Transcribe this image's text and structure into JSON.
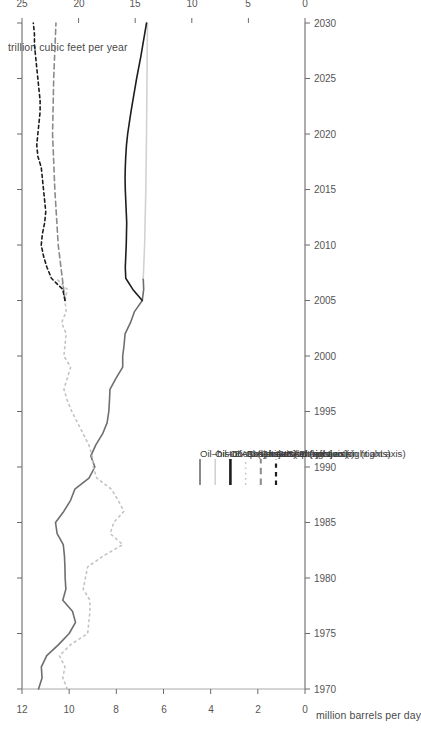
{
  "figure": {
    "orientation": "rotated-90-ccw",
    "background": "#ffffff"
  },
  "axes": {
    "left_axis_title": "million barrels per day",
    "right_axis_title": "trillion cubic feet per year",
    "left_ticks": [
      "0",
      "2",
      "4",
      "6",
      "8",
      "10",
      "12"
    ],
    "right_ticks": [
      "0",
      "5",
      "10",
      "15",
      "20",
      "25"
    ],
    "x_ticks": [
      "1970",
      "1975",
      "1980",
      "1985",
      "1990",
      "1995",
      "2000",
      "2005",
      "2010",
      "2015",
      "2020",
      "2025",
      "2030"
    ]
  },
  "legend": {
    "items": [
      {
        "label": "Oil–historical (left axis)",
        "style": "solid",
        "color": "#6e6e6e",
        "width": 1.6
      },
      {
        "label": "Oil–IEA projection (left axis)",
        "style": "solid",
        "color": "#d2d2d2",
        "width": 1.6
      },
      {
        "label": "Oil–EIA projection (left axis)",
        "style": "solid",
        "color": "#1d1d1d",
        "width": 2.6
      },
      {
        "label": "Gas–historical (right axis)",
        "style": "dotted",
        "color": "#c3c3c3",
        "width": 1.5
      },
      {
        "label": "Gas–IEA projection (right axis)",
        "style": "dashed",
        "color": "#8a8a8a",
        "width": 2.0
      },
      {
        "label": "Gas–EIA projection (right axis)",
        "style": "dashdot",
        "color": "#1d1d1d",
        "width": 2.2
      }
    ]
  },
  "chart_data": {
    "type": "line",
    "title": "",
    "xlabel": "",
    "ylabel": "million barrels per day",
    "y2label": "trillion cubic feet per year",
    "xlim": [
      1970,
      2030
    ],
    "ylim": [
      0,
      12
    ],
    "y2lim": [
      0,
      25
    ],
    "grid": false,
    "legend_position": "bottom-center",
    "series": [
      {
        "name": "Oil–historical (left axis)",
        "axis": "left",
        "style": "solid",
        "color": "#6e6e6e",
        "x": [
          1970,
          1971,
          1972,
          1973,
          1974,
          1975,
          1976,
          1977,
          1978,
          1979,
          1980,
          1981,
          1982,
          1983,
          1984,
          1985,
          1986,
          1987,
          1988,
          1989,
          1990,
          1991,
          1992,
          1993,
          1994,
          1995,
          1996,
          1997,
          1998,
          1999,
          2000,
          2001,
          2002,
          2003,
          2004,
          2005,
          2006,
          2007
        ],
        "y": [
          11.3,
          11.15,
          11.18,
          10.95,
          10.45,
          10.0,
          9.73,
          9.86,
          10.27,
          10.14,
          10.17,
          10.18,
          10.2,
          10.25,
          10.51,
          10.58,
          10.23,
          9.94,
          9.76,
          9.16,
          8.91,
          9.08,
          8.87,
          8.58,
          8.39,
          8.32,
          8.29,
          8.27,
          8.01,
          7.73,
          7.73,
          7.67,
          7.63,
          7.4,
          7.23,
          6.9,
          6.84,
          6.86
        ]
      },
      {
        "name": "Oil–IEA projection (left axis)",
        "axis": "left",
        "style": "solid",
        "color": "#d2d2d2",
        "x": [
          2007,
          2010,
          2015,
          2020,
          2025,
          2030
        ],
        "y": [
          6.86,
          6.8,
          6.75,
          6.72,
          6.7,
          6.68
        ]
      },
      {
        "name": "Oil–EIA projection (left axis)",
        "axis": "left",
        "style": "solid",
        "color": "#1d1d1d",
        "x": [
          2005,
          2006,
          2007,
          2008,
          2009,
          2010,
          2011,
          2012,
          2013,
          2014,
          2015,
          2016,
          2017,
          2018,
          2019,
          2020,
          2021,
          2022,
          2023,
          2024,
          2025,
          2026,
          2027,
          2028,
          2029,
          2030
        ],
        "y": [
          6.9,
          7.3,
          7.6,
          7.62,
          7.6,
          7.58,
          7.57,
          7.56,
          7.58,
          7.6,
          7.62,
          7.63,
          7.62,
          7.6,
          7.57,
          7.52,
          7.45,
          7.38,
          7.3,
          7.22,
          7.14,
          7.05,
          6.96,
          6.88,
          6.8,
          6.72
        ]
      },
      {
        "name": "Gas–historical (right axis)",
        "axis": "right",
        "style": "dotted",
        "color": "#c3c3c3",
        "x": [
          1970,
          1971,
          1972,
          1973,
          1974,
          1975,
          1976,
          1977,
          1978,
          1979,
          1980,
          1981,
          1982,
          1983,
          1984,
          1985,
          1986,
          1987,
          1988,
          1989,
          1990,
          1991,
          1992,
          1993,
          1994,
          1995,
          1996,
          1997,
          1998,
          1999,
          2000,
          2001,
          2002,
          2003,
          2004,
          2005,
          2006,
          2007
        ],
        "y": [
          21.0,
          21.4,
          21.2,
          21.7,
          20.7,
          19.2,
          19.1,
          19.0,
          19.0,
          19.6,
          19.4,
          19.2,
          17.8,
          16.1,
          17.2,
          16.9,
          16.0,
          16.5,
          17.1,
          18.4,
          18.7,
          18.8,
          19.1,
          19.6,
          20.1,
          20.6,
          21.0,
          21.3,
          21.0,
          20.7,
          21.3,
          21.2,
          21.1,
          21.5,
          21.1,
          21.2,
          21.0,
          22.0
        ]
      },
      {
        "name": "Gas–IEA projection (right axis)",
        "axis": "right",
        "style": "dashed",
        "color": "#8a8a8a",
        "x": [
          2005,
          2010,
          2015,
          2020,
          2025,
          2030
        ],
        "y": [
          21.2,
          21.8,
          22.1,
          22.3,
          22.2,
          22.0
        ]
      },
      {
        "name": "Gas–EIA projection (right axis)",
        "axis": "right",
        "style": "dashdot",
        "color": "#1d1d1d",
        "x": [
          2005,
          2006,
          2007,
          2008,
          2009,
          2010,
          2011,
          2012,
          2013,
          2014,
          2015,
          2016,
          2017,
          2018,
          2019,
          2020,
          2021,
          2022,
          2023,
          2024,
          2025,
          2026,
          2027,
          2028,
          2029,
          2030
        ],
        "y": [
          21.2,
          21.4,
          22.4,
          22.8,
          23.1,
          23.3,
          23.2,
          23.0,
          22.9,
          23.0,
          23.1,
          23.2,
          23.3,
          23.6,
          23.7,
          23.6,
          23.5,
          23.4,
          23.4,
          23.5,
          23.6,
          23.7,
          23.8,
          23.9,
          23.9,
          24.0
        ]
      }
    ]
  }
}
